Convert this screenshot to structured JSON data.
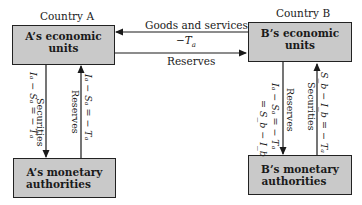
{
  "country_a": {
    "title": "Country A",
    "economic_units": "A’s economic units",
    "monetary_authorities_line1": "A’s monetary",
    "monetary_authorities_line2": "authorities"
  },
  "country_b": {
    "title": "Country B",
    "economic_units": "B’s economic units",
    "monetary_authorities_line1": "B’s monetary",
    "monetary_authorities_line2": "authorities"
  },
  "flows": {
    "goods_label": "Goods and services",
    "goods_value": "−T",
    "goods_value_sub": "a",
    "reserves_label": "Reserves",
    "a_securities_label": "Securities",
    "a_securities_eq": "Iₐ − Sₐ = − Tₐ",
    "a_reserves_label": "Reserves",
    "a_reserves_eq": "Iₐ − Sₐ = − Tₐ",
    "b_reserves_label": "Reserves",
    "b_reserves_eq1": "Iₐ − Sₐ = − Tₐ",
    "b_reserves_eq2": "= S_b − I_b",
    "b_securities_label": "Securities",
    "b_securities_eq": "S_b − I_b = − Tₐ"
  },
  "colors": {
    "box_fill": "#c9c9c9",
    "line": "#1a1a1a"
  }
}
